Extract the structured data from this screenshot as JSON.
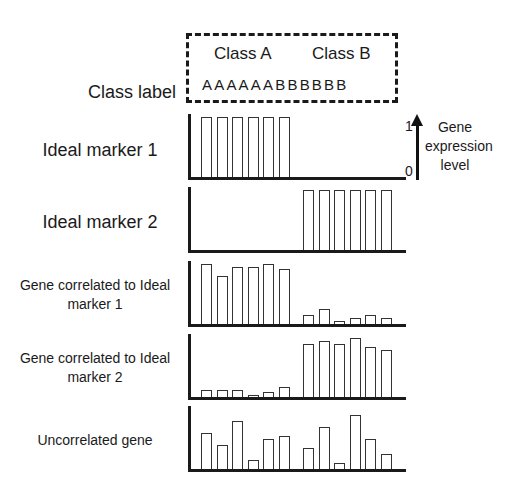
{
  "header": {
    "class_label": "Class label",
    "class_a": "Class A",
    "class_b": "Class B",
    "sequence": "AAAAAABBBBBB"
  },
  "legend": {
    "top_tick": "1",
    "bottom_tick": "0",
    "label": "Gene expression level"
  },
  "rows": [
    {
      "label": "Ideal marker 1"
    },
    {
      "label": "Ideal marker 2"
    },
    {
      "label": "Gene correlated to Ideal marker 1"
    },
    {
      "label": "Gene correlated to Ideal marker 2"
    },
    {
      "label": "Uncorrelated gene"
    }
  ],
  "colors": {
    "ink": "#1a1a1a",
    "bar_fill": "#ffffff",
    "bar_outline": "#333333"
  },
  "chart_data": {
    "type": "bar",
    "title": "",
    "categories": [
      "A",
      "A",
      "A",
      "A",
      "A",
      "A",
      "B",
      "B",
      "B",
      "B",
      "B",
      "B"
    ],
    "xlabel": "Class label",
    "ylabel": "Gene expression level",
    "ylim": [
      0,
      1
    ],
    "grid": false,
    "legend_position": "right",
    "series": [
      {
        "name": "Ideal marker 1",
        "values": [
          1,
          1,
          1,
          1,
          1,
          1,
          0,
          0,
          0,
          0,
          0,
          0
        ]
      },
      {
        "name": "Ideal marker 2",
        "values": [
          0,
          0,
          0,
          0,
          0,
          0,
          1,
          1,
          1,
          1,
          1,
          1
        ]
      },
      {
        "name": "Gene correlated to Ideal marker 1",
        "values": [
          1.0,
          0.8,
          0.95,
          0.95,
          1.0,
          0.92,
          0.15,
          0.25,
          0.05,
          0.1,
          0.15,
          0.1
        ]
      },
      {
        "name": "Gene correlated to Ideal marker 2",
        "values": [
          0.12,
          0.11,
          0.11,
          0.04,
          0.08,
          0.16,
          0.88,
          0.93,
          0.88,
          0.98,
          0.83,
          0.78
        ]
      },
      {
        "name": "Uncorrelated gene",
        "values": [
          0.6,
          0.4,
          0.8,
          0.15,
          0.5,
          0.55,
          0.35,
          0.7,
          0.1,
          0.9,
          0.5,
          0.25
        ]
      }
    ]
  }
}
